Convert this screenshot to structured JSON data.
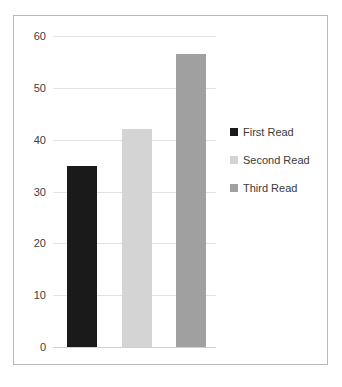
{
  "chart_data": {
    "type": "bar",
    "title": "",
    "subtitle": "",
    "xlabel": "",
    "ylabel": "",
    "categories": [
      "First Read",
      "Second Read",
      "Third Read"
    ],
    "values": [
      35,
      42,
      56.5
    ],
    "ylim": [
      0,
      60
    ],
    "yticks": [
      "0",
      "10",
      "20",
      "30",
      "40",
      "50",
      "60"
    ],
    "ytick_values": [
      0,
      10,
      20,
      30,
      40,
      50,
      60
    ],
    "xtick_labels": [],
    "grid": true,
    "grid_axis": "y",
    "legend_position": "right",
    "series": [
      {
        "name": "First Read",
        "value": 35,
        "color": "#1a1a1a"
      },
      {
        "name": "Second Read",
        "value": 42,
        "color": "#d4d4d4"
      },
      {
        "name": "Third Read",
        "value": 56.5,
        "color": "#a0a0a0"
      }
    ],
    "annotations": []
  },
  "legend": {
    "items": [
      {
        "label": "First Read",
        "color": "#1a1a1a"
      },
      {
        "label": "Second Read",
        "color": "#d4d4d4"
      },
      {
        "label": "Third Read",
        "color": "#a0a0a0"
      }
    ]
  },
  "frame": {
    "border_color": "#b9b9b9",
    "background": "#ffffff"
  }
}
